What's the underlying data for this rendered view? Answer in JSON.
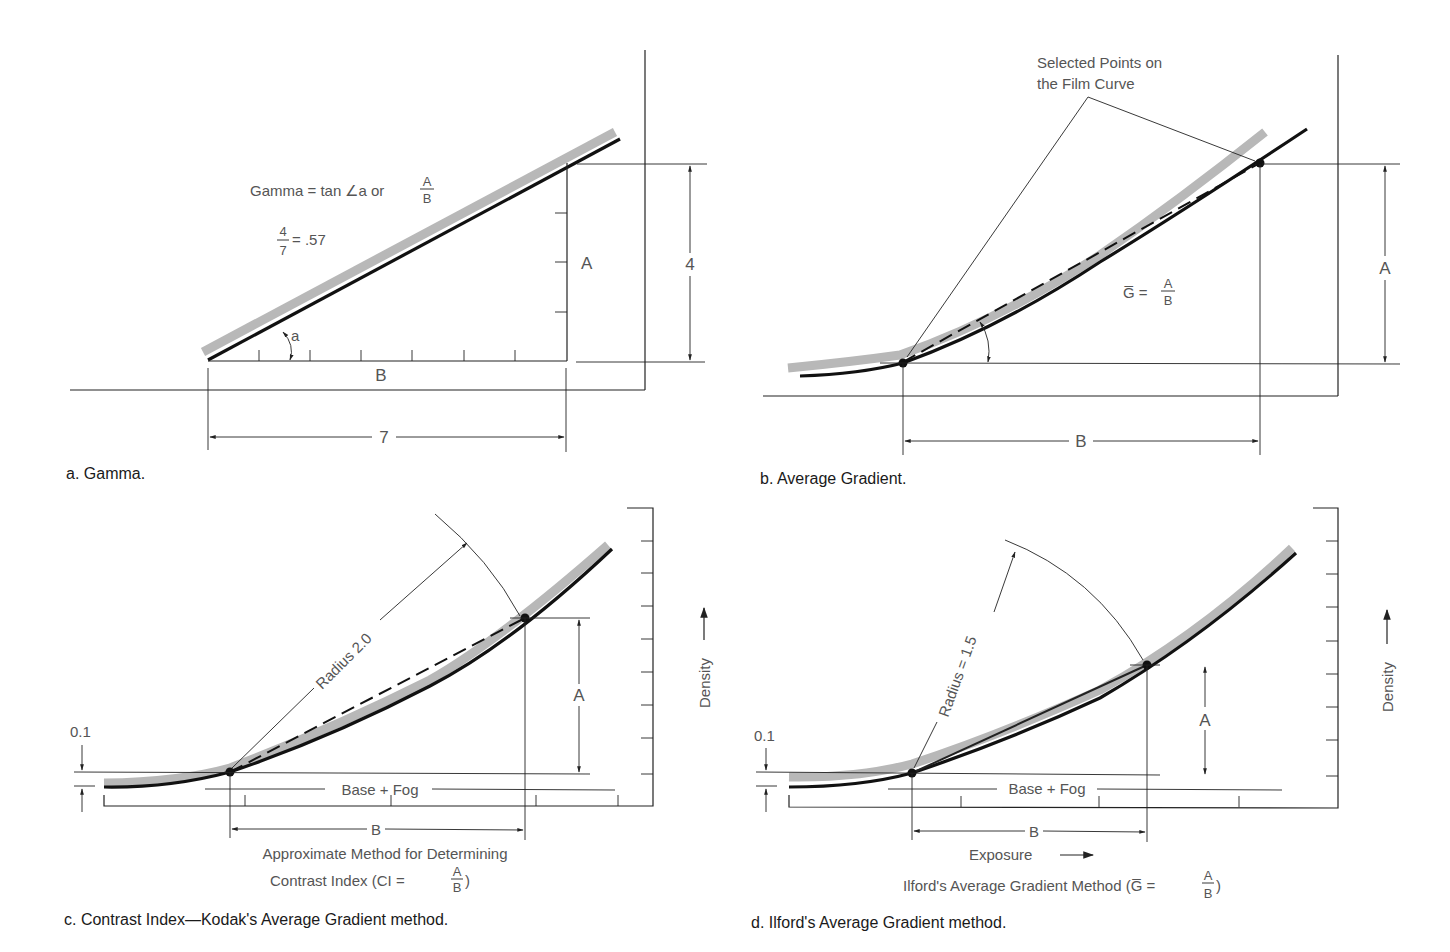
{
  "panels": {
    "a": {
      "caption": "a. Gamma.",
      "formula_main": "Gamma = tan ∠a or",
      "formula_frac_num": "A",
      "formula_frac_den": "B",
      "example_num": "4",
      "example_den": "7",
      "example_result": "= .57",
      "angle_label": "a",
      "label_a": "A",
      "label_b": "B",
      "dim_vertical": "4",
      "dim_horizontal": "7"
    },
    "b": {
      "caption": "b. Average Gradient.",
      "callout_line1": "Selected Points on",
      "callout_line2": "the Film Curve",
      "formula_lhs": "G̅ =",
      "formula_num": "A",
      "formula_den": "B",
      "label_a": "A",
      "label_b": "B"
    },
    "c": {
      "caption": "c. Contrast Index—Kodak's Average Gradient method.",
      "radius_label": "Radius 2.0",
      "offset_label": "0.1",
      "base_fog": "Base + Fog",
      "label_a": "A",
      "label_b": "B",
      "axis_y": "Density",
      "subtitle_line1": "Approximate Method for Determining",
      "subtitle_line2": "Contrast Index (CI =",
      "subtitle_num": "A",
      "subtitle_den": "B",
      "subtitle_close": ")"
    },
    "d": {
      "caption": "d. Ilford's Average Gradient method.",
      "radius_label": "Radius = 1.5",
      "offset_label": "0.1",
      "base_fog": "Base + Fog",
      "label_a": "A",
      "label_b": "B",
      "axis_y": "Density",
      "axis_x": "Exposure",
      "subtitle": "Ilford's Average Gradient Method (G̅ =",
      "subtitle_num": "A",
      "subtitle_den": "B",
      "subtitle_close": ")"
    }
  },
  "colors": {
    "curve": "#111111",
    "band": "#b8b8b8",
    "label": "#555555",
    "caption": "#1a1a1a"
  }
}
